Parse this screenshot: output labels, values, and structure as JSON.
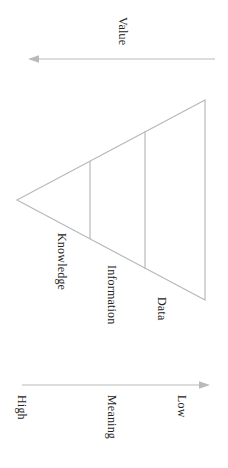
{
  "figure": {
    "orientation": "rotated-90",
    "line_color": "#b9b9b9",
    "text_color": "#242424",
    "background": "#ffffff"
  },
  "top_axis": {
    "label": "Value",
    "direction": "left",
    "arrow_name": "value-axis-arrow"
  },
  "pyramid": {
    "tiers": [
      {
        "id": "knowledge",
        "label": "Knowledge"
      },
      {
        "id": "information",
        "label": "Information"
      },
      {
        "id": "data",
        "label": "Data"
      }
    ]
  },
  "bottom_axis": {
    "label": "Meaning",
    "direction": "right",
    "arrow_name": "meaning-axis-arrow",
    "ticks": [
      {
        "id": "high",
        "label": "High"
      },
      {
        "id": "low",
        "label": "Low"
      }
    ]
  }
}
